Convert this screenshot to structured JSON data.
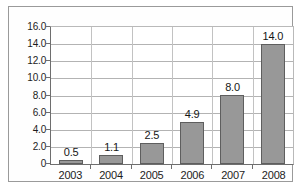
{
  "chart_data": {
    "type": "bar",
    "title": "",
    "subtitle": "",
    "xlabel": "",
    "ylabel": "",
    "categories": [
      "2003",
      "2004",
      "2005",
      "2006",
      "2007",
      "2008"
    ],
    "values": [
      0.5,
      1.1,
      2.5,
      4.9,
      8.0,
      14.0
    ],
    "value_labels": [
      "0.5",
      "1.1",
      "2.5",
      "4.9",
      "8.0",
      "14.0"
    ],
    "ylim": [
      0,
      16
    ],
    "ytick_values": [
      0,
      2,
      4,
      6,
      8,
      10,
      12,
      14,
      16
    ],
    "ytick_labels": [
      "0",
      "2.0",
      "4.0",
      "6.0",
      "8.0",
      "10.0",
      "12.0",
      "14.0",
      "16.0"
    ],
    "grid": {
      "horizontal": true,
      "vertical": true
    },
    "legend": {
      "visible": false,
      "position": "none",
      "entries": []
    },
    "annotations": [],
    "colors": {
      "bar_fill": "#989898",
      "bar_border": "#5e5e5e",
      "gridline": "#b3b3b3",
      "axis": "#6e6e6e",
      "frame": "#9a9a9a",
      "background": "#ffffff",
      "text": "#1c1c1c"
    }
  }
}
